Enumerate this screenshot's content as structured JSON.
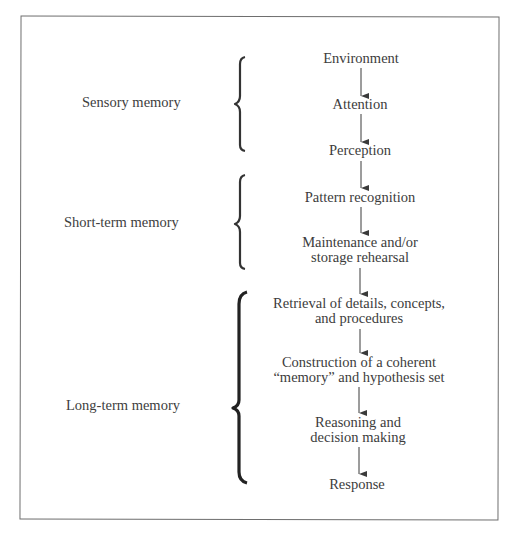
{
  "diagram": {
    "type": "memory-process-flowchart",
    "groups": [
      {
        "id": "sensory",
        "label": "Sensory memory",
        "steps": [
          0,
          1,
          2
        ]
      },
      {
        "id": "short_term",
        "label": "Short-term memory",
        "steps": [
          3,
          4
        ]
      },
      {
        "id": "long_term",
        "label": "Long-term memory",
        "steps": [
          5,
          6,
          7,
          8
        ]
      }
    ],
    "steps": [
      {
        "text": "Environment"
      },
      {
        "text": "Attention"
      },
      {
        "text": "Perception"
      },
      {
        "text": "Pattern recognition"
      },
      {
        "line1": "Maintenance and/or",
        "line2": "storage rehearsal"
      },
      {
        "line1": "Retrieval of details, concepts,",
        "line2": "and procedures"
      },
      {
        "line1": "Construction of a coherent",
        "line2": "“memory” and hypothesis set"
      },
      {
        "line1": "Reasoning and",
        "line2": "decision making"
      },
      {
        "text": "Response"
      }
    ],
    "arrows": [
      {
        "from": 0,
        "to": 1
      },
      {
        "from": 1,
        "to": 2
      },
      {
        "from": 2,
        "to": 3
      },
      {
        "from": 3,
        "to": 4
      },
      {
        "from": 4,
        "to": 5
      },
      {
        "from": 5,
        "to": 6
      },
      {
        "from": 6,
        "to": 7
      },
      {
        "from": 7,
        "to": 8
      }
    ],
    "colors": {
      "line": "#3a3a3a",
      "border": "#6e6e6e",
      "text": "#3c3c3c"
    }
  }
}
